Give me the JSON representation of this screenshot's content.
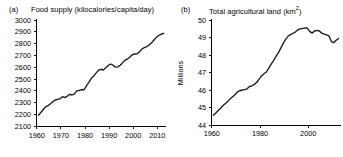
{
  "figure": {
    "background": "#ffffff",
    "line_color": "#1a1a1a"
  },
  "panel_a": {
    "tag": "(a)",
    "title": "Food supply (kilocalories/capita/day)",
    "y_axis_label": "",
    "x_tick_labels": [
      "1960",
      "1970",
      "1980",
      "1990",
      "2000",
      "2010"
    ],
    "y_tick_labels": [
      "2100",
      "2200",
      "2300",
      "2400",
      "2500",
      "2600",
      "2700",
      "2800",
      "2900",
      "3000"
    ]
  },
  "panel_b": {
    "tag": "(b)",
    "title_main": "Total agricultural land (km",
    "title_sup": "2",
    "title_tail": ")",
    "title": "Total agricultural land (km2)",
    "y_axis_label": "Millions",
    "x_tick_labels": [
      "1960",
      "1980",
      "2000"
    ],
    "y_tick_labels": [
      "44",
      "45",
      "46",
      "47",
      "48",
      "49",
      "50"
    ]
  },
  "chart_data": [
    {
      "type": "line",
      "panel": "(a)",
      "title": "Food supply (kilocalories/capita/day)",
      "xlabel": "",
      "ylabel": "kilocalories/capita/day",
      "xlim": [
        1960,
        2014
      ],
      "ylim": [
        2100,
        3000
      ],
      "xticks": [
        1960,
        1970,
        1980,
        1990,
        2000,
        2010
      ],
      "yticks": [
        2100,
        2200,
        2300,
        2400,
        2500,
        2600,
        2700,
        2800,
        2900,
        3000
      ],
      "grid": false,
      "legend": "none",
      "x": [
        1961,
        1962,
        1963,
        1964,
        1965,
        1966,
        1967,
        1968,
        1969,
        1970,
        1971,
        1972,
        1973,
        1974,
        1975,
        1976,
        1977,
        1978,
        1979,
        1980,
        1981,
        1982,
        1983,
        1984,
        1985,
        1986,
        1987,
        1988,
        1989,
        1990,
        1991,
        1992,
        1993,
        1994,
        1995,
        1996,
        1997,
        1998,
        1999,
        2000,
        2001,
        2002,
        2003,
        2004,
        2005,
        2006,
        2007,
        2008,
        2009,
        2010,
        2011,
        2012,
        2013
      ],
      "values": [
        2192,
        2215,
        2240,
        2262,
        2272,
        2288,
        2306,
        2320,
        2326,
        2330,
        2348,
        2340,
        2352,
        2368,
        2362,
        2372,
        2398,
        2400,
        2408,
        2406,
        2440,
        2470,
        2502,
        2522,
        2548,
        2570,
        2578,
        2572,
        2590,
        2610,
        2622,
        2612,
        2596,
        2598,
        2612,
        2634,
        2654,
        2664,
        2682,
        2700,
        2706,
        2708,
        2724,
        2748,
        2760,
        2768,
        2782,
        2800,
        2824,
        2846,
        2862,
        2872,
        2880
      ],
      "series": [
        {
          "name": "Food supply",
          "values": [
            2192,
            2215,
            2240,
            2262,
            2272,
            2288,
            2306,
            2320,
            2326,
            2330,
            2348,
            2340,
            2352,
            2368,
            2362,
            2372,
            2398,
            2400,
            2408,
            2406,
            2440,
            2470,
            2502,
            2522,
            2548,
            2570,
            2578,
            2572,
            2590,
            2610,
            2622,
            2612,
            2596,
            2598,
            2612,
            2634,
            2654,
            2664,
            2682,
            2700,
            2706,
            2708,
            2724,
            2748,
            2760,
            2768,
            2782,
            2800,
            2824,
            2846,
            2862,
            2872,
            2880
          ]
        }
      ]
    },
    {
      "type": "line",
      "panel": "(b)",
      "title": "Total agricultural land (km2)",
      "xlabel": "",
      "ylabel": "Millions",
      "xlim": [
        1960,
        2014
      ],
      "ylim": [
        44,
        50
      ],
      "xticks": [
        1960,
        1980,
        2000
      ],
      "yticks": [
        44,
        45,
        46,
        47,
        48,
        49,
        50
      ],
      "grid": false,
      "legend": "none",
      "x": [
        1961,
        1962,
        1963,
        1964,
        1965,
        1966,
        1967,
        1968,
        1969,
        1970,
        1971,
        1972,
        1973,
        1974,
        1975,
        1976,
        1977,
        1978,
        1979,
        1980,
        1981,
        1982,
        1983,
        1984,
        1985,
        1986,
        1987,
        1988,
        1989,
        1990,
        1991,
        1992,
        1993,
        1994,
        1995,
        1996,
        1997,
        1998,
        1999,
        2000,
        2001,
        2002,
        2003,
        2004,
        2005,
        2006,
        2007,
        2008,
        2009,
        2010,
        2011,
        2012,
        2013
      ],
      "values": [
        44.55,
        44.68,
        44.82,
        44.95,
        45.1,
        45.22,
        45.34,
        45.48,
        45.6,
        45.72,
        45.88,
        45.94,
        45.98,
        46.0,
        46.05,
        46.18,
        46.22,
        46.3,
        46.42,
        46.6,
        46.78,
        46.9,
        47.0,
        47.22,
        47.45,
        47.65,
        47.88,
        48.1,
        48.35,
        48.62,
        48.85,
        49.02,
        49.12,
        49.18,
        49.26,
        49.38,
        49.44,
        49.46,
        49.5,
        49.48,
        49.3,
        49.2,
        49.32,
        49.36,
        49.32,
        49.2,
        49.14,
        49.1,
        49.04,
        48.72,
        48.66,
        48.8,
        48.9
      ],
      "series": [
        {
          "name": "Total agricultural land",
          "values": [
            44.55,
            44.68,
            44.82,
            44.95,
            45.1,
            45.22,
            45.34,
            45.48,
            45.6,
            45.72,
            45.88,
            45.94,
            45.98,
            46.0,
            46.05,
            46.18,
            46.22,
            46.3,
            46.42,
            46.6,
            46.78,
            46.9,
            47.0,
            47.22,
            47.45,
            47.65,
            47.88,
            48.1,
            48.35,
            48.62,
            48.85,
            49.02,
            49.12,
            49.18,
            49.26,
            49.38,
            49.44,
            49.46,
            49.5,
            49.48,
            49.3,
            49.2,
            49.32,
            49.36,
            49.32,
            49.2,
            49.14,
            49.1,
            49.04,
            48.72,
            48.66,
            48.8,
            48.9
          ]
        }
      ]
    }
  ]
}
